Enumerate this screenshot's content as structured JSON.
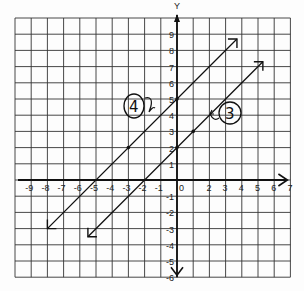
{
  "chart_data": {
    "type": "line",
    "title": "",
    "xlabel": "",
    "ylabel": "Y",
    "xlim": [
      -10,
      7
    ],
    "ylim": [
      -6,
      10
    ],
    "grid": true,
    "x_ticks": [
      "-9",
      "-8",
      "-7",
      "-6",
      "-5",
      "-4",
      "-3",
      "-2",
      "-1",
      "0",
      "",
      "2",
      "3",
      "4",
      "5",
      "6",
      "7"
    ],
    "y_ticks": [
      "9",
      "8",
      "7",
      "6",
      "5",
      "4",
      "3",
      "2",
      "1",
      "-1",
      "-2",
      "-3",
      "-4",
      "-5",
      "-6"
    ],
    "series": [
      {
        "name": "4",
        "equation": "y = x + 5",
        "points": [
          [
            -8,
            -3
          ],
          [
            -3,
            2
          ],
          [
            0,
            5
          ],
          [
            3.7,
            8.7
          ]
        ],
        "marked_points": [
          [
            -3,
            2
          ],
          [
            0,
            5
          ]
        ]
      },
      {
        "name": "3",
        "equation": "y = x + 2",
        "points": [
          [
            -5.5,
            -3.5
          ],
          [
            0,
            2
          ],
          [
            1,
            3
          ],
          [
            5.3,
            7.3
          ]
        ],
        "marked_points": [
          [
            0,
            2
          ],
          [
            1,
            3
          ]
        ]
      }
    ],
    "annotations": [
      {
        "text": "4",
        "circled": true,
        "near": "line y = x + 5"
      },
      {
        "text": "3",
        "circled": true,
        "near": "line y = x + 2"
      }
    ]
  },
  "labels": {
    "y_axis": "Y",
    "origin": "0",
    "line_a_tag": "4",
    "line_b_tag": "3"
  }
}
